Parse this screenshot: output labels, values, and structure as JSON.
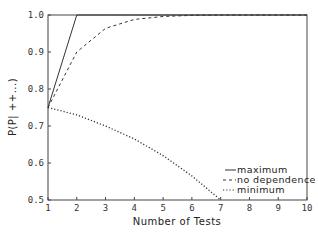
{
  "chart_data": {
    "type": "line",
    "title": "",
    "xlabel": "Number of Tests",
    "ylabel": "P(P| ++...)",
    "xlim": [
      1,
      10
    ],
    "ylim": [
      0.5,
      1.0
    ],
    "xticks": [
      1,
      2,
      3,
      4,
      5,
      6,
      7,
      8,
      9,
      10
    ],
    "yticks": [
      "0.5",
      "0.6",
      "0.7",
      "0.8",
      "0.9",
      "1.0"
    ],
    "grid": false,
    "legend_position": "lower right, inside plot",
    "series": [
      {
        "name": "maximum",
        "style": "solid",
        "x": [
          1,
          2,
          3,
          4,
          5,
          6,
          7,
          8,
          9,
          10
        ],
        "values": [
          0.75,
          1.0,
          1.0,
          1.0,
          1.0,
          1.0,
          1.0,
          1.0,
          1.0,
          1.0
        ]
      },
      {
        "name": "no dependence",
        "style": "dashed",
        "x": [
          1,
          2,
          3,
          4,
          5,
          6,
          7,
          8,
          9,
          10
        ],
        "values": [
          0.75,
          0.9,
          0.964,
          0.988,
          0.996,
          0.999,
          1.0,
          1.0,
          1.0,
          1.0
        ]
      },
      {
        "name": "minimum",
        "style": "dotted",
        "x": [
          1,
          2,
          3,
          4,
          5,
          6,
          7
        ],
        "values": [
          0.75,
          0.73,
          0.7,
          0.665,
          0.62,
          0.565,
          0.5
        ]
      }
    ]
  },
  "legend": {
    "items": [
      {
        "marker": "—",
        "label": "maximum"
      },
      {
        "marker": "- -",
        "label": "no dependence"
      },
      {
        "marker": "· · ·",
        "label": "minimum"
      }
    ]
  }
}
